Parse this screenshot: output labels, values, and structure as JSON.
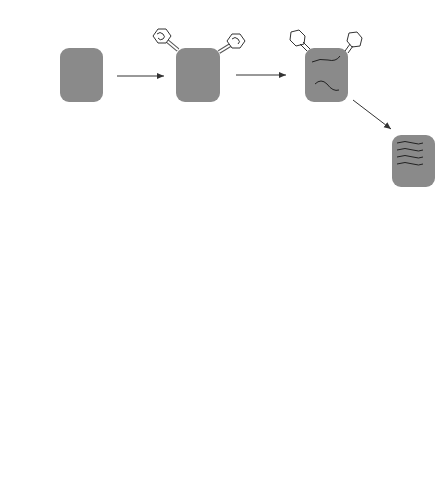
{
  "figure": {
    "cells": {
      "host_start": {
        "species": "E. coli",
        "strain": "B"
      },
      "test_hosts": [
        {
          "species": "E. coli",
          "strain": "K (λ)",
          "phage_label": "xy",
          "result": "No growth"
        },
        {
          "species": "E. coli",
          "strain": "K (λ)",
          "phage_label": "x or y",
          "result": "No growth"
        },
        {
          "species": "E. coli",
          "strain": "K (λ)",
          "phage_label": "+ +",
          "result": "Lysis"
        }
      ]
    },
    "phages": {
      "mutant_x": "T4rIIx",
      "mutant_y": "T4rIIy"
    },
    "chromosome_labels": {
      "x": "x",
      "y": "y",
      "plus": "+"
    },
    "colors": {
      "cell_fill": "#8a8a8a",
      "arrow": "#333333",
      "background": "#ffffff"
    }
  }
}
